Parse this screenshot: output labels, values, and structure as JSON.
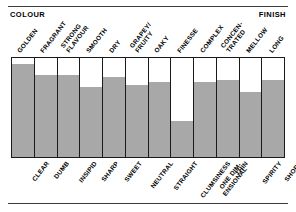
{
  "header": {
    "left_label": "COLOUR",
    "right_label": "FINISH"
  },
  "colors": {
    "bar_fill": "#a8a8a8",
    "frame": "#1a1a1a",
    "rule": "#3b3b3b",
    "background": "#ffffff",
    "text": "#000000"
  },
  "chart_data": {
    "type": "bar",
    "title": "",
    "subtitle": "",
    "xlabel": "",
    "ylabel": "",
    "ylim": [
      0,
      100
    ],
    "grid": false,
    "legend": "none",
    "axis_header_left": "COLOUR",
    "axis_header_right": "FINISH",
    "top_labels": [
      "GOLDEN",
      "FRAGRANT",
      "STRONG FLAVOUR",
      "SMOOTH",
      "DRY",
      "GRAPEY/ FRUITY",
      "OAKY",
      "FINESSE",
      "COMPLEX",
      "CONCEN- TRATED",
      "MELLOW",
      "LONG"
    ],
    "categories": [
      "CLEAR",
      "DUMB",
      "INSIPID",
      "SHARP",
      "SWEET",
      "NEUTRAL",
      "STRAIGHT",
      "CLUMSINESS",
      "ONE DIM- ENSIONAL",
      "THIN",
      "SPIRITY",
      "SHORT"
    ],
    "values": [
      94,
      83,
      83,
      71,
      81,
      73,
      76,
      36,
      76,
      78,
      66,
      78
    ]
  },
  "bars": [
    {
      "top_label": "GOLDEN",
      "top_line1": "GOLDEN",
      "top_line2": "",
      "bottom_label": "CLEAR",
      "bottom_line1": "CLEAR",
      "bottom_line2": "",
      "value": 94
    },
    {
      "top_label": "FRAGRANT",
      "top_line1": "FRAGRANT",
      "top_line2": "",
      "bottom_label": "DUMB",
      "bottom_line1": "DUMB",
      "bottom_line2": "",
      "value": 83
    },
    {
      "top_label": "STRONG FLAVOUR",
      "top_line1": "STRONG",
      "top_line2": "FLAVOUR",
      "bottom_label": "INSIPID",
      "bottom_line1": "INSIPID",
      "bottom_line2": "",
      "value": 83
    },
    {
      "top_label": "SMOOTH",
      "top_line1": "SMOOTH",
      "top_line2": "",
      "bottom_label": "SHARP",
      "bottom_line1": "SHARP",
      "bottom_line2": "",
      "value": 71
    },
    {
      "top_label": "DRY",
      "top_line1": "DRY",
      "top_line2": "",
      "bottom_label": "SWEET",
      "bottom_line1": "SWEET",
      "bottom_line2": "",
      "value": 81
    },
    {
      "top_label": "GRAPEY/ FRUITY",
      "top_line1": "GRAPEY/",
      "top_line2": "FRUITY",
      "bottom_label": "NEUTRAL",
      "bottom_line1": "NEUTRAL",
      "bottom_line2": "",
      "value": 73
    },
    {
      "top_label": "OAKY",
      "top_line1": "OAKY",
      "top_line2": "",
      "bottom_label": "STRAIGHT",
      "bottom_line1": "STRAIGHT",
      "bottom_line2": "",
      "value": 76
    },
    {
      "top_label": "FINESSE",
      "top_line1": "FINESSE",
      "top_line2": "",
      "bottom_label": "CLUMSINESS",
      "bottom_line1": "CLUMSINESS",
      "bottom_line2": "",
      "value": 36
    },
    {
      "top_label": "COMPLEX",
      "top_line1": "COMPLEX",
      "top_line2": "",
      "bottom_label": "ONE DIM- ENSIONAL",
      "bottom_line1": "ONE DIM-",
      "bottom_line2": "ENSIONAL",
      "value": 76
    },
    {
      "top_label": "CONCEN- TRATED",
      "top_line1": "CONCEN-",
      "top_line2": "TRATED",
      "bottom_label": "THIN",
      "bottom_line1": "THIN",
      "bottom_line2": "",
      "value": 78
    },
    {
      "top_label": "MELLOW",
      "top_line1": "MELLOW",
      "top_line2": "",
      "bottom_label": "SPIRITY",
      "bottom_line1": "SPIRITY",
      "bottom_line2": "",
      "value": 66
    },
    {
      "top_label": "LONG",
      "top_line1": "LONG",
      "top_line2": "",
      "bottom_label": "SHORT",
      "bottom_line1": "SHORT",
      "bottom_line2": "",
      "value": 78
    }
  ]
}
